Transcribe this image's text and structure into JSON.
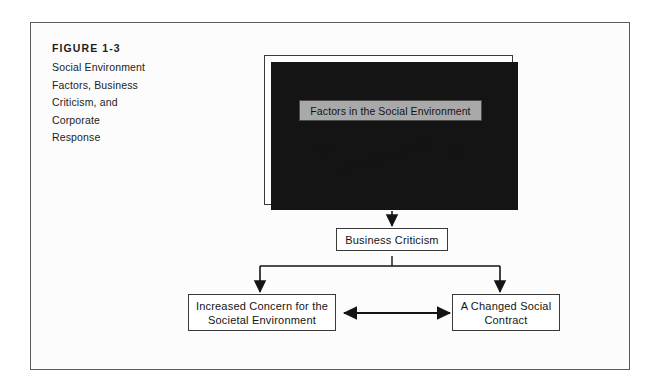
{
  "figure": {
    "label": "FIGURE 1-3",
    "title_lines": [
      "Social Environment",
      "Factors, Business",
      "Criticism, and",
      "Corporate",
      "Response"
    ]
  },
  "diagram": {
    "type": "flowchart",
    "nodes": [
      {
        "id": "social-environment-container",
        "label": "",
        "role": "container"
      },
      {
        "id": "affluence",
        "label": "Affluence",
        "role": "driver-label"
      },
      {
        "id": "awareness",
        "label": "Awareness",
        "role": "driver-label"
      },
      {
        "id": "education",
        "label": "Education",
        "role": "driver-label"
      },
      {
        "id": "factors-in-the-social-environment",
        "label": "Factors in the Social Environment",
        "role": "highlighted-box",
        "fill": "#a9a9a9"
      },
      {
        "id": "rising-expectations",
        "label": "Rising Expectations",
        "role": "label"
      },
      {
        "id": "rights-movement",
        "label": "Rights Movement",
        "role": "label"
      },
      {
        "id": "entitlement-mentality",
        "label": "Entitlement\nMentality",
        "role": "label"
      },
      {
        "id": "victimization-philosophy",
        "label": "Victimization\nPhilosophy",
        "role": "label"
      },
      {
        "id": "business-criticism",
        "label": "Business Criticism",
        "role": "box"
      },
      {
        "id": "increased-concern",
        "label": "Increased Concern for the\nSocietal Environment",
        "role": "box"
      },
      {
        "id": "changed-social-contract",
        "label": "A Changed Social\nContract",
        "role": "box"
      }
    ],
    "edges": [
      {
        "from": "rising-expectations",
        "to": "entitlement-mentality",
        "style": "arrow-down"
      },
      {
        "from": "rights-movement",
        "to": "victimization-philosophy",
        "style": "arrow-down"
      },
      {
        "from": "entitlement-mentality",
        "to": "rights-movement",
        "style": "arrow-diagonal"
      },
      {
        "from": "social-environment-container",
        "to": "business-criticism",
        "style": "arrow-down"
      },
      {
        "from": "business-criticism",
        "to": "increased-concern",
        "style": "arrow-elbow-down-left"
      },
      {
        "from": "business-criticism",
        "to": "changed-social-contract",
        "style": "arrow-elbow-down-right"
      },
      {
        "from": "increased-concern",
        "to": "changed-social-contract",
        "style": "arrow-bidirectional"
      }
    ],
    "labels": {
      "affluence": "Affluence",
      "awareness": "Awareness",
      "education": "Education",
      "factors": "Factors in the Social Environment",
      "rising_expectations": "Rising Expectations",
      "rights_movement": "Rights Movement",
      "entitlement_line1": "Entitlement",
      "entitlement_line2": "Mentality",
      "victimization_line1": "Victimization",
      "victimization_line2": "Philosophy",
      "business_criticism": "Business Criticism",
      "increased_concern_line1": "Increased Concern for the",
      "increased_concern_line2": "Societal Environment",
      "changed_contract_line1": "A Changed Social",
      "changed_contract_line2": "Contract"
    }
  },
  "colors": {
    "page_background": "#ffffff",
    "frame_background": "#fcfcfc",
    "frame_border": "#555a5e",
    "box_border": "#3a3a3a",
    "box_shadow": "#141414",
    "highlight_fill": "#a9a9a9",
    "text": "#141414"
  }
}
